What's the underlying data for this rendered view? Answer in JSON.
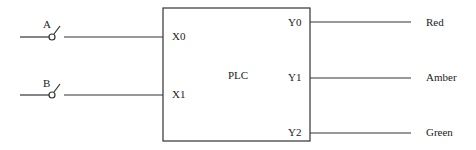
{
  "diagram": {
    "title": "PLC",
    "inputs": [
      {
        "switch_label": "A",
        "terminal": "X0"
      },
      {
        "switch_label": "B",
        "terminal": "X1"
      }
    ],
    "outputs": [
      {
        "terminal": "Y0",
        "label": "Red"
      },
      {
        "terminal": "Y1",
        "label": "Amber"
      },
      {
        "terminal": "Y2",
        "label": "Green"
      }
    ]
  }
}
